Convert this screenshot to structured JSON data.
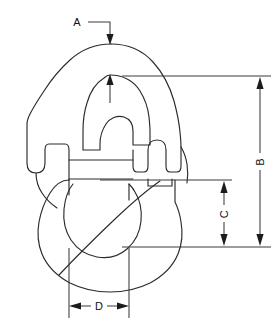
{
  "drawing": {
    "title": "Connecting Link Dimensional Drawing",
    "type": "engineering-line-drawing",
    "subject": "coupling connecting link",
    "background_color": "#ffffff",
    "line_color": "#2b2b2b",
    "dimension_line_color": "#3a3a3a",
    "label_color": "#121212",
    "canvas": {
      "width": 276,
      "height": 327
    },
    "dimensions": [
      {
        "id": "A",
        "label": "A",
        "orientation": "horizontal-text",
        "kind": "leader-callout",
        "description": "thickness at top crown of link, leader from label down to crown"
      },
      {
        "id": "B",
        "label": "B",
        "orientation": "vertical-text",
        "kind": "linear-vertical",
        "description": "overall height of link measured on the right side"
      },
      {
        "id": "C",
        "label": "C",
        "orientation": "vertical-text",
        "kind": "linear-vertical",
        "description": "lower eye opening height measured on the right side"
      },
      {
        "id": "D",
        "label": "D",
        "orientation": "horizontal-text",
        "kind": "linear-horizontal",
        "description": "inner width of lower eye measured at the bottom"
      }
    ]
  }
}
